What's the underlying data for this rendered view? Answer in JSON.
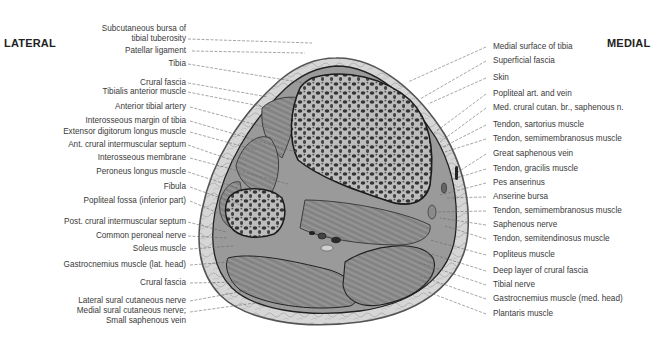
{
  "figure": {
    "orientation": {
      "lateral": "LATERAL",
      "medial": "MEDIAL"
    },
    "left_labels": [
      {
        "text": "Subcutaneous bursa of\ntibial tuberosity",
        "line1": "Subcutaneous bursa of",
        "line2": "tibial tuberosity"
      },
      {
        "text": "Patellar ligament"
      },
      {
        "text": "Tibia"
      },
      {
        "text": "Crural fascia"
      },
      {
        "text": "Tibialis anterior muscle"
      },
      {
        "text": "Anterior tibial artery"
      },
      {
        "text": "Interosseous margin of tibia"
      },
      {
        "text": "Extensor digitorum longus muscle"
      },
      {
        "text": "Ant. crural intermuscular septum"
      },
      {
        "text": "Interosseous membrane"
      },
      {
        "text": "Peroneus longus muscle"
      },
      {
        "text": "Fibula"
      },
      {
        "text": "Popliteal fossa (inferior part)"
      },
      {
        "text": "Post. crural intermuscular septum"
      },
      {
        "text": "Common peroneal nerve"
      },
      {
        "text": "Soleus muscle"
      },
      {
        "text": "Gastrocnemius muscle (lat. head)"
      },
      {
        "text": "Crural fascia"
      },
      {
        "text": "Lateral sural cutaneous nerve"
      },
      {
        "text": "Medial sural cutaneous nerve;\nSmall saphenous vein",
        "line1": "Medial sural cutaneous nerve;",
        "line2": "Small saphenous vein"
      }
    ],
    "right_labels": [
      {
        "text": "Medial surface of tibia"
      },
      {
        "text": "Superficial fascia"
      },
      {
        "text": "Skin"
      },
      {
        "text": "Popliteal art. and vein"
      },
      {
        "text": "Med. crural cutan. br., saphenous n."
      },
      {
        "text": "Tendon, sartorius muscle"
      },
      {
        "text": "Tendon, semimembranosus muscle"
      },
      {
        "text": "Great saphenous vein"
      },
      {
        "text": "Tendon, gracilis muscle"
      },
      {
        "text": "Pes anserinus"
      },
      {
        "text": "Anserine bursa"
      },
      {
        "text": "Tendon, semimembranosus muscle"
      },
      {
        "text": "Saphenous nerve"
      },
      {
        "text": "Tendon, semitendinosus muscle"
      },
      {
        "text": "Popliteus muscle"
      },
      {
        "text": "Deep layer of crural fascia"
      },
      {
        "text": "Tibial nerve"
      },
      {
        "text": "Gastrocnemius muscle (med. head)"
      },
      {
        "text": "Plantaris muscle"
      }
    ],
    "colors": {
      "skin": "#d9d9d9",
      "subcutaneous": "#c4c4c4",
      "muscle": "#8e8e8e",
      "bone_fill": "#b5b5b5",
      "bone_pores": "#3a3a3a",
      "outline": "#222222",
      "leader_line": "#666666"
    }
  }
}
